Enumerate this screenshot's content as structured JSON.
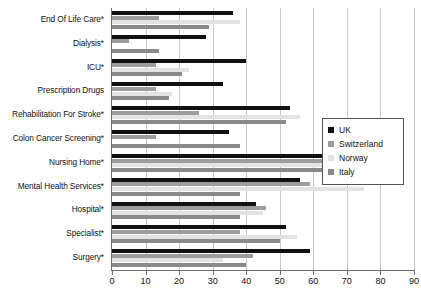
{
  "chart_data": {
    "type": "bar",
    "orientation": "horizontal",
    "title": "",
    "xlabel": "",
    "ylabel": "",
    "xlim": [
      0,
      90
    ],
    "xticks": [
      0,
      10,
      20,
      30,
      40,
      50,
      60,
      70,
      80,
      90
    ],
    "grid": true,
    "legend_position": "right",
    "categories": [
      "End Of Life Care*",
      "Dialysis*",
      "ICU*",
      "Prescription Drugs",
      "Rehabilitation For Stroke*",
      "Colon Cancer Screening*",
      "Nursing Home*",
      "Mental Health Services*",
      "Hospital*",
      "Specialist*",
      "Surgery*"
    ],
    "series": [
      {
        "name": "UK",
        "color": "#101010",
        "values": [
          36,
          28,
          40,
          33,
          53,
          35,
          72,
          56,
          43,
          52,
          59
        ]
      },
      {
        "name": "Switzerland",
        "color": "#9d9d9d",
        "values": [
          14,
          5,
          13,
          13,
          26,
          13,
          68,
          59,
          46,
          38,
          42
        ]
      },
      {
        "name": "Norway",
        "color": "#e3e3e3",
        "values": [
          38,
          0,
          23,
          18,
          56,
          0,
          84,
          75,
          45,
          55,
          33
        ]
      },
      {
        "name": "Italy",
        "color": "#8a8a8a",
        "values": [
          29,
          14,
          21,
          17,
          52,
          38,
          67,
          38,
          38,
          50,
          40
        ]
      }
    ]
  },
  "legend": {
    "entries": [
      {
        "label": "UK",
        "swatch": "uk"
      },
      {
        "label": "Switzerland",
        "swatch": "swi"
      },
      {
        "label": "Norway",
        "swatch": "nor"
      },
      {
        "label": "Italy",
        "swatch": "ita"
      }
    ]
  }
}
